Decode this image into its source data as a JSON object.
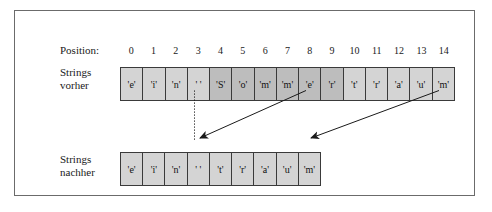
{
  "diagram": {
    "labels": {
      "position": "Position:",
      "before": "Strings\nvorher",
      "after": "Strings\nnachher"
    },
    "positions": [
      "0",
      "1",
      "2",
      "3",
      "4",
      "5",
      "6",
      "7",
      "8",
      "9",
      "10",
      "11",
      "12",
      "13",
      "14"
    ],
    "before_row": {
      "cells": [
        {
          "text": "'e'",
          "highlight": false
        },
        {
          "text": "'i'",
          "highlight": false
        },
        {
          "text": "'n'",
          "highlight": false
        },
        {
          "text": "' '",
          "highlight": false
        },
        {
          "text": "'S'",
          "highlight": true
        },
        {
          "text": "'o'",
          "highlight": true
        },
        {
          "text": "'m'",
          "highlight": true
        },
        {
          "text": "'m'",
          "highlight": true
        },
        {
          "text": "'e'",
          "highlight": true
        },
        {
          "text": "'r'",
          "highlight": true
        },
        {
          "text": "'t'",
          "highlight": false
        },
        {
          "text": "'r'",
          "highlight": false
        },
        {
          "text": "'a'",
          "highlight": false
        },
        {
          "text": "'u'",
          "highlight": false
        },
        {
          "text": "'m'",
          "highlight": false
        }
      ]
    },
    "after_row": {
      "cells": [
        {
          "text": "'e'",
          "highlight": false
        },
        {
          "text": "'i'",
          "highlight": false
        },
        {
          "text": "'n'",
          "highlight": false
        },
        {
          "text": "' '",
          "highlight": false
        },
        {
          "text": "'t'",
          "highlight": false
        },
        {
          "text": "'r'",
          "highlight": false
        },
        {
          "text": "'a'",
          "highlight": false
        },
        {
          "text": "'u'",
          "highlight": false
        },
        {
          "text": "'m'",
          "highlight": false
        }
      ]
    },
    "colors": {
      "frame_border": "#6b6b6b",
      "cell_fill": "#d4d4d4",
      "cell_highlight_fill": "#bdbdbd",
      "cell_border": "#3a3a3a",
      "arrow": "#1a1a1a",
      "background": "#ffffff"
    }
  }
}
